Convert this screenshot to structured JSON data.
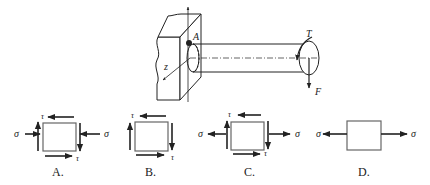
{
  "main_figure": {
    "point_label": "A",
    "axis_label": "z",
    "torque_label": "T",
    "force_label": "F"
  },
  "options": [
    {
      "id": "A",
      "label": "A.",
      "sigma_left": "σ",
      "sigma_right": "σ",
      "tau_top": "τ",
      "tau_bottom": "τ",
      "sigma_type": "compression"
    },
    {
      "id": "B",
      "label": "B.",
      "tau_top": "τ",
      "tau_bottom": "τ",
      "sigma_type": "none"
    },
    {
      "id": "C",
      "label": "C.",
      "sigma_left": "σ",
      "sigma_right": "σ",
      "tau_top": "τ",
      "tau_bottom": "τ",
      "sigma_type": "tension"
    },
    {
      "id": "D",
      "label": "D.",
      "sigma_left": "σ",
      "sigma_right": "σ",
      "sigma_type": "tension_only"
    }
  ],
  "colors": {
    "stroke": "#222222",
    "box": "#666666"
  }
}
